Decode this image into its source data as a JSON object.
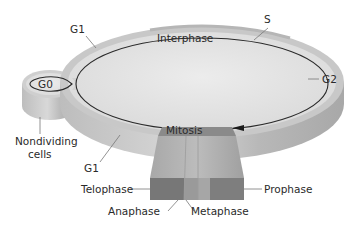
{
  "diagram": {
    "colors": {
      "disc_top": "#e4e4e4",
      "disc_rim": "#c6c6c6",
      "disc_side": "#b0b0b0",
      "cycle_line": "#2a2a2a",
      "column_dark": "#7a7a7a",
      "column_mid": "#9a9a9a",
      "column_light": "#b4b4b4",
      "mitosis_band": "#7e7e7e",
      "label_text": "#2a2a2a",
      "leader_line": "#777777"
    },
    "labels": {
      "interphase": "Interphase",
      "g1_top": "G1",
      "s": "S",
      "g2": "G2",
      "g0": "G0",
      "nondividing_line1": "Nondividing",
      "nondividing_line2": "cells",
      "g1_bottom": "G1",
      "mitosis": "Mitosis",
      "telophase": "Telophase",
      "anaphase": "Anaphase",
      "metaphase": "Metaphase",
      "prophase": "Prophase"
    },
    "phases": [
      {
        "name": "G1",
        "group": "Interphase"
      },
      {
        "name": "S",
        "group": "Interphase"
      },
      {
        "name": "G2",
        "group": "Interphase"
      },
      {
        "name": "Mitosis",
        "subphases": [
          "Prophase",
          "Metaphase",
          "Anaphase",
          "Telophase"
        ]
      },
      {
        "name": "G0",
        "description": "Nondividing cells"
      }
    ]
  }
}
